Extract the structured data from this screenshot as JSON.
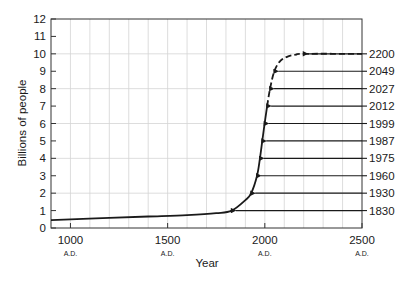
{
  "chart_data": {
    "type": "line",
    "title": "",
    "xlabel": "Year",
    "ylabel": "Billions of people",
    "xlim": [
      900,
      2500
    ],
    "ylim": [
      0,
      12
    ],
    "x_ticks": [
      {
        "value": 1000,
        "label": "1000",
        "sublabel": "A.D."
      },
      {
        "value": 1500,
        "label": "1500",
        "sublabel": "A.D."
      },
      {
        "value": 2000,
        "label": "2000",
        "sublabel": "A.D."
      },
      {
        "value": 2500,
        "label": "2500",
        "sublabel": "A.D."
      }
    ],
    "y_ticks": [
      0,
      1,
      2,
      3,
      4,
      5,
      6,
      7,
      8,
      9,
      10,
      11,
      12
    ],
    "grid": {
      "vertical_every_years": 100,
      "horizontal_every": 2
    },
    "series": [
      {
        "name": "World population (actual)",
        "style": "solid",
        "x": [
          900,
          1000,
          1200,
          1400,
          1600,
          1750,
          1830,
          1900,
          1930,
          1960,
          1975,
          1987,
          1999,
          2012
        ],
        "y": [
          0.45,
          0.5,
          0.58,
          0.66,
          0.74,
          0.85,
          1.0,
          1.6,
          2.0,
          3.0,
          4.0,
          5.0,
          6.0,
          7.0
        ]
      },
      {
        "name": "World population (projected)",
        "style": "dashed",
        "x": [
          2012,
          2027,
          2049,
          2080,
          2120,
          2160,
          2200,
          2500
        ],
        "y": [
          7.0,
          8.0,
          9.0,
          9.6,
          9.85,
          9.95,
          10.0,
          10.0
        ]
      }
    ],
    "annotations": [
      {
        "billions": 1,
        "year": "1830"
      },
      {
        "billions": 2,
        "year": "1930"
      },
      {
        "billions": 3,
        "year": "1960"
      },
      {
        "billions": 4,
        "year": "1975"
      },
      {
        "billions": 5,
        "year": "1987"
      },
      {
        "billions": 6,
        "year": "1999"
      },
      {
        "billions": 7,
        "year": "2012"
      },
      {
        "billions": 8,
        "year": "2027"
      },
      {
        "billions": 9,
        "year": "2049"
      },
      {
        "billions": 10,
        "year": "2200"
      }
    ]
  },
  "colors": {
    "line": "#1a1a1a",
    "grid": "#d4d4d4",
    "frame": "#333333"
  }
}
